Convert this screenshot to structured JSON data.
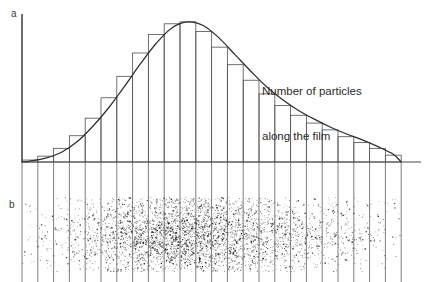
{
  "figure": {
    "width": 436,
    "height": 282,
    "background": "#ffffff"
  },
  "panels": {
    "a": {
      "label": "a",
      "kind": "histogram-with-curve"
    },
    "b": {
      "label": "b",
      "kind": "particle-track-speckle"
    }
  },
  "annotation": {
    "line1": "Number of particles",
    "line2": "along the film"
  },
  "colors": {
    "axis": "#4a4a4a",
    "bar_outline": "#5a5a5a",
    "curve": "#2e2e2e",
    "gridline": "#5f5f5f",
    "speckle": "#1b1b1b",
    "text": "#2b2b2b"
  },
  "geometry": {
    "axis_x": 22,
    "baseline_y": 162,
    "axis_top_y": 14,
    "baseline_right_x": 421,
    "bar_width": 15.8,
    "bar_count": 24,
    "grid_bottom_y": 282,
    "speckle_top_y": 197,
    "speckle_bottom_y": 272,
    "speckle_left_x": 22,
    "speckle_right_x": 404
  },
  "chart_data": {
    "type": "bar",
    "title": "",
    "xlabel": "",
    "ylabel": "Number of particles along the film",
    "ylim": [
      0,
      150
    ],
    "grid": false,
    "legend": null,
    "note": "Bragg-like depth distribution: number of particles along the film. Bar heights in arbitrary units; curve is the smooth envelope through the bar tops.",
    "categories": [
      "1",
      "2",
      "3",
      "4",
      "5",
      "6",
      "7",
      "8",
      "9",
      "10",
      "11",
      "12",
      "13",
      "14",
      "15",
      "16",
      "17",
      "18",
      "19",
      "20",
      "21",
      "22",
      "23",
      "24"
    ],
    "values": [
      2,
      6,
      14,
      27,
      45,
      66,
      88,
      112,
      131,
      142,
      144,
      134,
      118,
      100,
      84,
      70,
      58,
      48,
      40,
      33,
      26,
      20,
      14,
      7
    ],
    "series": [
      {
        "name": "histogram",
        "values": [
          2,
          6,
          14,
          27,
          45,
          66,
          88,
          112,
          131,
          142,
          144,
          134,
          118,
          100,
          84,
          70,
          58,
          48,
          40,
          33,
          26,
          20,
          14,
          7
        ]
      },
      {
        "name": "smooth-envelope-curve",
        "values": [
          1,
          4,
          10,
          21,
          37,
          56,
          78,
          101,
          122,
          138,
          144,
          140,
          127,
          110,
          93,
          77,
          64,
          53,
          44,
          36,
          29,
          23,
          16,
          8
        ]
      }
    ],
    "speckle_density": [
      0.04,
      0.06,
      0.1,
      0.18,
      0.3,
      0.45,
      0.62,
      0.78,
      0.92,
      1.0,
      1.0,
      0.93,
      0.82,
      0.7,
      0.58,
      0.48,
      0.4,
      0.33,
      0.27,
      0.22,
      0.17,
      0.12,
      0.07,
      0.03
    ]
  }
}
